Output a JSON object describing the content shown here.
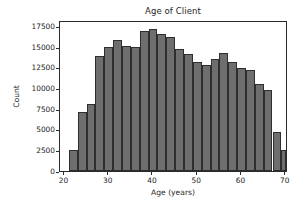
{
  "chart_data": {
    "type": "bar",
    "title": "Age of Client",
    "xlabel": "Age (years)",
    "ylabel": "Count",
    "xlim": [
      19.0,
      70.5
    ],
    "ylim": [
      0,
      18300
    ],
    "grid": false,
    "legend": null,
    "bin_width": 2,
    "bar_color": "#6e6e6e",
    "bar_edge_color": "#2e2e2e",
    "xticks": [
      20,
      30,
      40,
      50,
      60,
      70
    ],
    "xtick_labels": [
      "20",
      "30",
      "40",
      "50",
      "60",
      "70"
    ],
    "yticks": [
      0,
      2500,
      5000,
      7500,
      10000,
      12500,
      15000,
      17500
    ],
    "ytick_labels": [
      "0",
      "2500",
      "5000",
      "7500",
      "10000",
      "12500",
      "15000",
      "17500"
    ],
    "bins": [
      {
        "x0": 21,
        "x1": 23,
        "value": 2600
      },
      {
        "x0": 23,
        "x1": 25,
        "value": 7200
      },
      {
        "x0": 25,
        "x1": 27,
        "value": 8100
      },
      {
        "x0": 27,
        "x1": 29,
        "value": 13950
      },
      {
        "x0": 29,
        "x1": 31,
        "value": 15050
      },
      {
        "x0": 31,
        "x1": 33,
        "value": 15900
      },
      {
        "x0": 33,
        "x1": 35,
        "value": 15200
      },
      {
        "x0": 35,
        "x1": 37,
        "value": 15050
      },
      {
        "x0": 37,
        "x1": 39,
        "value": 17000
      },
      {
        "x0": 39,
        "x1": 41,
        "value": 17200
      },
      {
        "x0": 41,
        "x1": 43,
        "value": 16650
      },
      {
        "x0": 43,
        "x1": 45,
        "value": 16200
      },
      {
        "x0": 45,
        "x1": 47,
        "value": 14800
      },
      {
        "x0": 47,
        "x1": 49,
        "value": 14150
      },
      {
        "x0": 49,
        "x1": 51,
        "value": 13250
      },
      {
        "x0": 51,
        "x1": 53,
        "value": 12900
      },
      {
        "x0": 53,
        "x1": 55,
        "value": 13550
      },
      {
        "x0": 55,
        "x1": 57,
        "value": 14250
      },
      {
        "x0": 57,
        "x1": 59,
        "value": 13200
      },
      {
        "x0": 59,
        "x1": 61,
        "value": 12500
      },
      {
        "x0": 61,
        "x1": 63,
        "value": 12200
      },
      {
        "x0": 63,
        "x1": 65,
        "value": 10500
      },
      {
        "x0": 65,
        "x1": 67,
        "value": 9800
      },
      {
        "x0": 67,
        "x1": 69,
        "value": 4700
      },
      {
        "x0": 69,
        "x1": 70,
        "value": 2600
      }
    ],
    "categories": [
      "21-23",
      "23-25",
      "25-27",
      "27-29",
      "29-31",
      "31-33",
      "33-35",
      "35-37",
      "37-39",
      "39-41",
      "41-43",
      "43-45",
      "45-47",
      "47-49",
      "49-51",
      "51-53",
      "53-55",
      "55-57",
      "57-59",
      "59-61",
      "61-63",
      "63-65",
      "65-67",
      "67-69",
      "69-70"
    ],
    "values": [
      2600,
      7200,
      8100,
      13950,
      15050,
      15900,
      15200,
      15050,
      17000,
      17200,
      16650,
      16200,
      14800,
      14150,
      13250,
      12900,
      13550,
      14250,
      13200,
      12500,
      12200,
      10500,
      9800,
      4700,
      2600
    ]
  }
}
